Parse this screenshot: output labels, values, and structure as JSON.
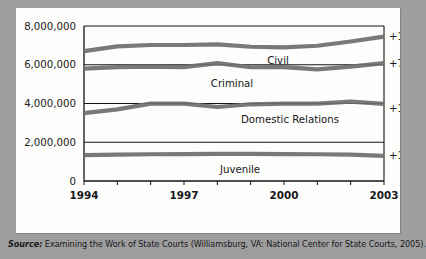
{
  "chart_data": {
    "type": "line",
    "title": "",
    "xlabel": "",
    "ylabel": "",
    "x": [
      1994,
      1995,
      1996,
      1997,
      1998,
      1999,
      2000,
      2001,
      2002,
      2003
    ],
    "xlim": [
      1994,
      2003
    ],
    "ylim": [
      0,
      8000000
    ],
    "grid": true,
    "ytick_labels": [
      "8,000,000",
      "6,000,000",
      "4,000,000",
      "2,000,000",
      "0"
    ],
    "ytick_values": [
      8000000,
      6000000,
      4000000,
      2000000,
      0
    ],
    "xtick_labels": [
      "1994",
      "1997",
      "2000",
      "2003"
    ],
    "xtick_values": [
      1994,
      1997,
      2000,
      2003
    ],
    "legend_position": "inline-right",
    "series": [
      {
        "name": "Civil",
        "change_label": "+13%",
        "values": [
          6700000,
          6950000,
          7020000,
          7020000,
          7050000,
          6930000,
          6900000,
          6980000,
          7200000,
          7450000
        ]
      },
      {
        "name": "Criminal",
        "change_label": "+7%",
        "values": [
          5800000,
          5880000,
          5900000,
          5880000,
          6080000,
          5870000,
          5880000,
          5760000,
          5900000,
          6080000
        ]
      },
      {
        "name": "Domestic Relations",
        "change_label": "+14%",
        "values": [
          3500000,
          3700000,
          3990000,
          3990000,
          3820000,
          3960000,
          3990000,
          3990000,
          4100000,
          3980000
        ]
      },
      {
        "name": "Juvenile",
        "change_label": "+10%",
        "values": [
          1340000,
          1360000,
          1380000,
          1390000,
          1400000,
          1400000,
          1390000,
          1380000,
          1360000,
          1300000
        ]
      }
    ]
  },
  "caption": {
    "source_word": "Source:",
    "source_text": "Examining the Work of State Courts (Williamsburg, VA: National Center for State Courts, 2005)."
  },
  "colors": {
    "series_line": "#6e6e70",
    "axis": "#141414",
    "panel_background": "#fdfdfb",
    "page_background": "#9e9e9e",
    "text": "#17171a"
  }
}
